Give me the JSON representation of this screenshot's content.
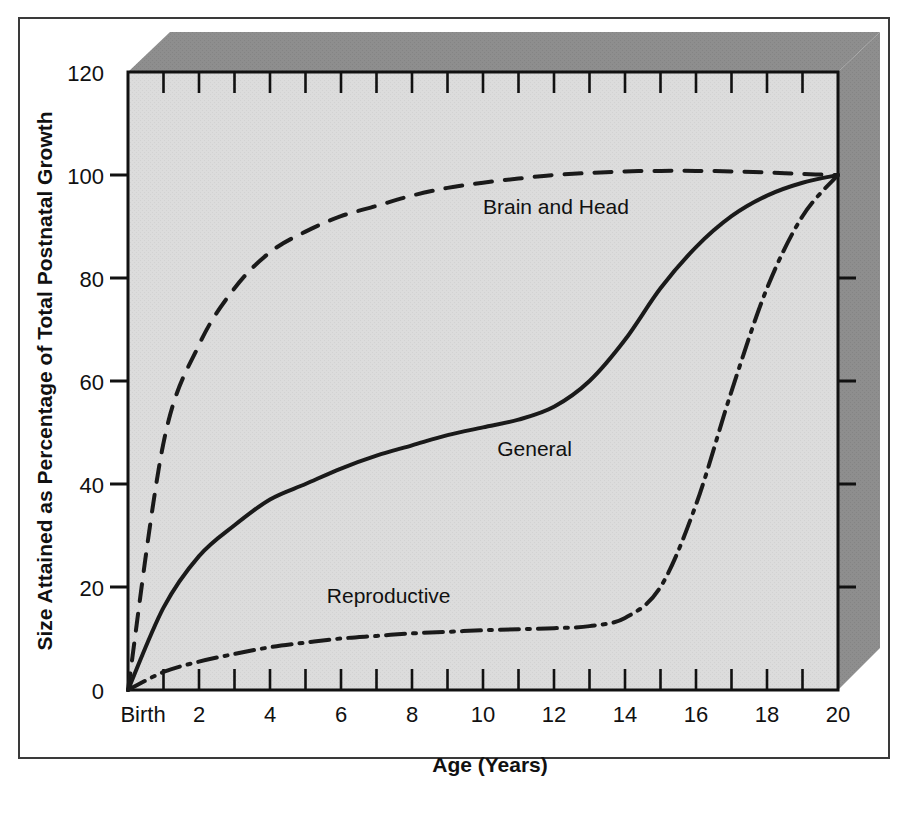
{
  "figure": {
    "background_color": "#ffffff",
    "frame_color": "#3a3a3a",
    "plot_background_color": "#d9d9d9",
    "shadow_color": "#8c8c8c",
    "line_color": "#1a1a1a"
  },
  "chart_data": {
    "type": "line",
    "title": "",
    "xlabel": "Age (Years)",
    "ylabel": "Size Attained as Percentage of Total Postnatal Growth",
    "xlim": [
      0,
      20
    ],
    "ylim": [
      0,
      120
    ],
    "grid": false,
    "legend_position": "inline-annotations",
    "x_tick_labels": [
      "Birth",
      "2",
      "4",
      "6",
      "8",
      "10",
      "12",
      "14",
      "16",
      "18",
      "20"
    ],
    "x_tick_values": [
      0,
      2,
      4,
      6,
      8,
      10,
      12,
      14,
      16,
      18,
      20
    ],
    "x_minor_tick_values": [
      1,
      3,
      5,
      7,
      9,
      11,
      13,
      15,
      17,
      19
    ],
    "y_tick_labels": [
      "0",
      "20",
      "40",
      "60",
      "80",
      "100",
      "120"
    ],
    "y_tick_values": [
      0,
      20,
      40,
      60,
      80,
      100,
      120
    ],
    "x": [
      0,
      1,
      2,
      3,
      4,
      5,
      6,
      7,
      8,
      9,
      10,
      11,
      12,
      13,
      14,
      15,
      16,
      17,
      18,
      19,
      20
    ],
    "series": [
      {
        "name": "Brain and Head",
        "style": "dashed",
        "label_x": 10.0,
        "label_y": 92.5,
        "values": [
          0,
          48,
          67,
          78,
          85,
          89,
          92,
          94,
          96,
          97.5,
          98.5,
          99.3,
          100,
          100.4,
          100.7,
          100.8,
          100.8,
          100.7,
          100.5,
          100.2,
          100
        ]
      },
      {
        "name": "General",
        "style": "solid",
        "label_x": 10.4,
        "label_y": 45.5,
        "values": [
          0,
          16,
          26,
          32,
          37,
          40,
          43,
          45.5,
          47.5,
          49.5,
          51,
          52.5,
          55,
          60,
          68,
          78,
          86,
          92,
          96,
          98.5,
          100
        ]
      },
      {
        "name": "Reproductive",
        "style": "dashdot",
        "label_x": 5.6,
        "label_y": 17.0,
        "values": [
          0,
          3.5,
          5.5,
          7,
          8.3,
          9.2,
          10,
          10.5,
          11,
          11.3,
          11.6,
          11.8,
          12,
          12.4,
          14,
          20,
          36,
          58,
          78,
          92,
          100
        ]
      }
    ]
  },
  "annotations": {
    "brain_and_head": "Brain and Head",
    "general": "General",
    "reproductive": "Reproductive"
  },
  "axis_titles": {
    "x": "Age (Years)",
    "y": "Size Attained as Percentage of Total Postnatal Growth"
  }
}
